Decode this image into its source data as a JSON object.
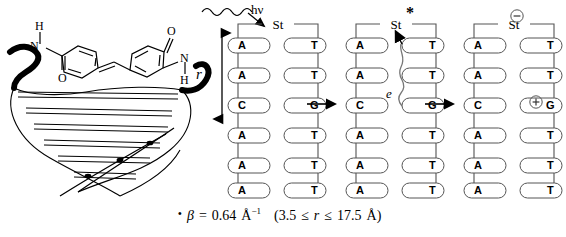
{
  "figure": {
    "photon_label": "hν",
    "distance_label": "r",
    "chromophore_label": "St",
    "excited_marker": "*",
    "electron_label": "e",
    "anion_symbol": "−",
    "cation_symbol": "+",
    "reaction_arrow": "→"
  },
  "base_pairs": [
    {
      "left": "A",
      "right": "T"
    },
    {
      "left": "A",
      "right": "T"
    },
    {
      "left": "C",
      "right": "G"
    },
    {
      "left": "A",
      "right": "T"
    },
    {
      "left": "A",
      "right": "T"
    },
    {
      "left": "A",
      "right": "T"
    }
  ],
  "panels": [
    {
      "name": "initial",
      "top_label": "St"
    },
    {
      "name": "excited",
      "top_label": "St"
    },
    {
      "name": "charge-separated",
      "top_label": "St"
    }
  ],
  "equation": {
    "bullet": "•",
    "beta_symbol": "β",
    "equals": "=",
    "beta_value": "0.64",
    "beta_unit": "Å",
    "beta_exponent": "−1",
    "range_open": "(",
    "range_min": "3.5",
    "le1": "≤",
    "range_variable": "r",
    "le2": "≤",
    "range_max": "17.5",
    "range_unit": "Å",
    "range_close": ")"
  },
  "molecule": {
    "name": "stilbenedicarboxamide",
    "atom_labels": [
      "H",
      "N",
      "O",
      "O",
      "N",
      "H"
    ]
  },
  "colors": {
    "ink": "#000000",
    "base_fill": "#ffffff",
    "base_stroke": "#555555",
    "backbone": "#777777"
  }
}
